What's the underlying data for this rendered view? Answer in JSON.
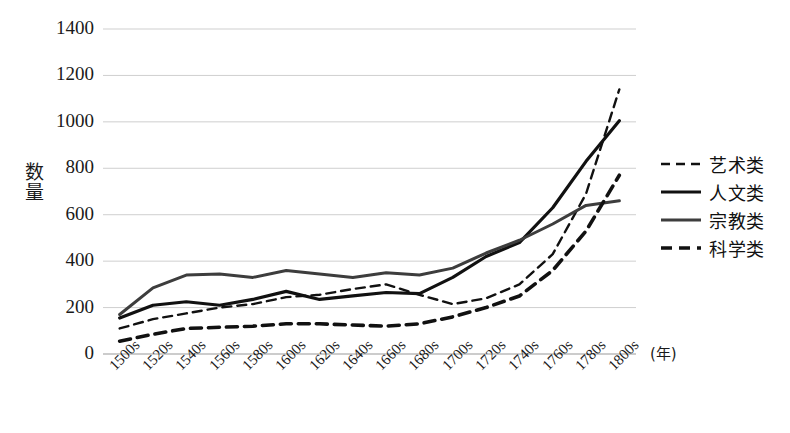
{
  "chart_data": {
    "type": "line",
    "title": "",
    "xlabel": "(年)",
    "ylabel": "数量",
    "ylim": [
      0,
      1400
    ],
    "ytick_step": 200,
    "grid": true,
    "legend_position": "right",
    "categories": [
      "1500s",
      "1520s",
      "1540s",
      "1560s",
      "1580s",
      "1600s",
      "1620s",
      "1640s",
      "1660s",
      "1680s",
      "1700s",
      "1720s",
      "1740s",
      "1760s",
      "1780s",
      "1800s"
    ],
    "ytick_labels": [
      "0",
      "200",
      "400",
      "600",
      "800",
      "1000",
      "1200",
      "1400"
    ],
    "series": [
      {
        "name": "艺术类",
        "style": "dashed-thin",
        "color": "#111111",
        "values": [
          110,
          150,
          175,
          200,
          215,
          245,
          255,
          280,
          300,
          255,
          215,
          240,
          300,
          430,
          690,
          1140
        ]
      },
      {
        "name": "人文类",
        "style": "solid-thick",
        "color": "#111111",
        "values": [
          155,
          210,
          225,
          210,
          235,
          270,
          235,
          250,
          265,
          260,
          330,
          420,
          480,
          630,
          830,
          1005
        ]
      },
      {
        "name": "宗教类",
        "style": "solid-medium",
        "color": "#3d3d3d",
        "values": [
          170,
          285,
          340,
          345,
          330,
          360,
          345,
          330,
          350,
          340,
          370,
          435,
          490,
          560,
          640,
          660
        ]
      },
      {
        "name": "科学类",
        "style": "dashed-thick",
        "color": "#111111",
        "values": [
          55,
          85,
          110,
          115,
          120,
          130,
          130,
          125,
          120,
          130,
          160,
          200,
          250,
          360,
          530,
          770
        ]
      }
    ]
  },
  "legend": {
    "items": [
      {
        "label": "艺术类"
      },
      {
        "label": "人文类"
      },
      {
        "label": "宗教类"
      },
      {
        "label": "科学类"
      }
    ]
  },
  "axis": {
    "unit_label": "(年)",
    "y_title": "数量"
  }
}
